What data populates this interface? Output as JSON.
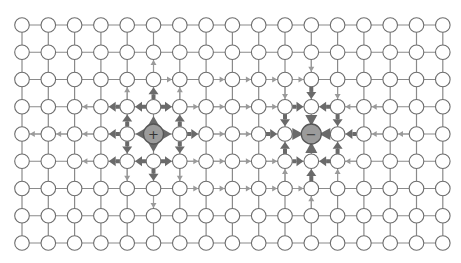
{
  "grid": {
    "cols": 17,
    "rows": 9,
    "x0": 22,
    "y0": 25,
    "dx": 26.3,
    "dy": 27.25,
    "node_radius": 7.3
  },
  "colors": {
    "background": "#ffffff",
    "edge": "#8a8a8a",
    "node_stroke": "#6e6e6e",
    "thin_arrow": "#9a9a9a",
    "thick_arrow": "#6a6a6a",
    "charge_fill": "#9b9b9b"
  },
  "charges": [
    {
      "name": "positive-charge",
      "col": 5,
      "row": 4,
      "sign": "+",
      "radius": 10,
      "petals": "out"
    },
    {
      "name": "negative-charge",
      "col": 11,
      "row": 4,
      "sign": "−",
      "radius": 10,
      "petals": "in"
    }
  ],
  "arrows": {
    "thick": [
      [
        5,
        3,
        5,
        2
      ],
      [
        5,
        3,
        4,
        3
      ],
      [
        5,
        3,
        6,
        3
      ],
      [
        4,
        4,
        4,
        3
      ],
      [
        4,
        4,
        4,
        5
      ],
      [
        4,
        4,
        3,
        4
      ],
      [
        6,
        4,
        6,
        3
      ],
      [
        6,
        4,
        6,
        5
      ],
      [
        6,
        4,
        7,
        4
      ],
      [
        5,
        5,
        5,
        6
      ],
      [
        5,
        5,
        4,
        5
      ],
      [
        5,
        5,
        6,
        5
      ],
      [
        4,
        3,
        3,
        3
      ],
      [
        4,
        5,
        3,
        5
      ],
      [
        11,
        2,
        11,
        3
      ],
      [
        10,
        3,
        11,
        3
      ],
      [
        12,
        3,
        11,
        3
      ],
      [
        10,
        3,
        10,
        4
      ],
      [
        12,
        3,
        12,
        4
      ],
      [
        9,
        4,
        10,
        4
      ],
      [
        13,
        4,
        12,
        4
      ],
      [
        10,
        5,
        10,
        4
      ],
      [
        12,
        5,
        12,
        4
      ],
      [
        10,
        5,
        11,
        5
      ],
      [
        12,
        5,
        11,
        5
      ],
      [
        11,
        6,
        11,
        5
      ]
    ],
    "thin": [
      [
        5,
        2,
        5,
        1
      ],
      [
        5,
        2,
        6,
        2
      ],
      [
        6,
        3,
        6,
        2
      ],
      [
        6,
        3,
        7,
        3
      ],
      [
        4,
        3,
        4,
        2
      ],
      [
        3,
        3,
        2,
        3
      ],
      [
        3,
        4,
        2,
        4
      ],
      [
        3,
        5,
        2,
        5
      ],
      [
        2,
        4,
        1,
        4
      ],
      [
        1,
        4,
        0,
        4
      ],
      [
        4,
        5,
        4,
        6
      ],
      [
        5,
        6,
        5,
        7
      ],
      [
        6,
        5,
        6,
        6
      ],
      [
        6,
        6,
        7,
        6
      ],
      [
        6,
        5,
        7,
        5
      ],
      [
        7,
        2,
        8,
        2
      ],
      [
        8,
        2,
        9,
        2
      ],
      [
        9,
        2,
        10,
        2
      ],
      [
        10,
        2,
        11,
        2
      ],
      [
        7,
        3,
        8,
        3
      ],
      [
        8,
        3,
        9,
        3
      ],
      [
        9,
        3,
        10,
        3
      ],
      [
        7,
        4,
        8,
        4
      ],
      [
        8,
        4,
        9,
        4
      ],
      [
        7,
        5,
        8,
        5
      ],
      [
        8,
        5,
        9,
        5
      ],
      [
        9,
        5,
        10,
        5
      ],
      [
        7,
        6,
        8,
        6
      ],
      [
        8,
        6,
        9,
        6
      ],
      [
        9,
        6,
        10,
        6
      ],
      [
        10,
        6,
        11,
        6
      ],
      [
        11,
        1,
        11,
        2
      ],
      [
        12,
        2,
        12,
        3
      ],
      [
        10,
        2,
        10,
        3
      ],
      [
        13,
        3,
        12,
        3
      ],
      [
        14,
        3,
        13,
        3
      ],
      [
        14,
        4,
        13,
        4
      ],
      [
        15,
        4,
        14,
        4
      ],
      [
        13,
        5,
        12,
        5
      ],
      [
        10,
        6,
        10,
        5
      ],
      [
        12,
        6,
        12,
        5
      ],
      [
        11,
        7,
        11,
        6
      ]
    ]
  }
}
